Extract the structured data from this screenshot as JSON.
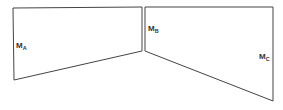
{
  "diagram": {
    "stroke_color": "#444444",
    "panels": [
      {
        "id": "A",
        "label_main": "M",
        "label_sub": "A",
        "points": "13,8 142,7 142,51 14,80"
      },
      {
        "id": "B",
        "points": "145,7 273,7 273,101 145,51"
      }
    ],
    "labels": [
      {
        "id": "MA",
        "main": "M",
        "sub": "A",
        "x": 16,
        "y": 48
      },
      {
        "id": "MB",
        "main": "M",
        "sub": "B",
        "x": 148,
        "y": 31
      },
      {
        "id": "MC",
        "main": "M",
        "sub": "C",
        "x": 259,
        "y": 59
      }
    ]
  }
}
